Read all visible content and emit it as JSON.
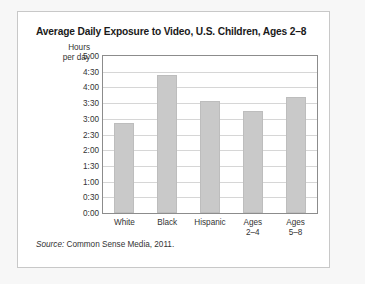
{
  "chart_data": {
    "type": "bar",
    "title": "Average Daily Exposure to Video, U.S. Children, Ages 2–8",
    "ylabel": "Hours\nper day",
    "ylabel_line1": "Hours",
    "ylabel_line2": "per day",
    "xlabel": "",
    "categories": [
      "White",
      "Black",
      "Hispanic",
      "Ages\n2–4",
      "Ages\n5–8"
    ],
    "values": [
      2.87,
      4.39,
      3.57,
      3.25,
      3.7
    ],
    "value_labels": [
      "2:52",
      "4:23",
      "3:34",
      "3:15",
      "3:42"
    ],
    "ylim": [
      0,
      5
    ],
    "ytick_labels": [
      "5:00",
      "4:30",
      "4:00",
      "3:30",
      "3:00",
      "2:30",
      "2:00",
      "1:30",
      "1:00",
      "0:30",
      "0:00"
    ],
    "ytick_values": [
      5,
      4.5,
      4,
      3.5,
      3,
      2.5,
      2,
      1.5,
      1,
      0.5,
      0
    ],
    "grid": true,
    "legend": false,
    "bar_color": "#c9c9c9",
    "bar_border_color": "#bdbdbd",
    "axis_color": "#8c8c8c",
    "grid_color": "#d6d6d6"
  },
  "source": {
    "label": "Source:",
    "text": " Common Sense Media, 2011."
  }
}
